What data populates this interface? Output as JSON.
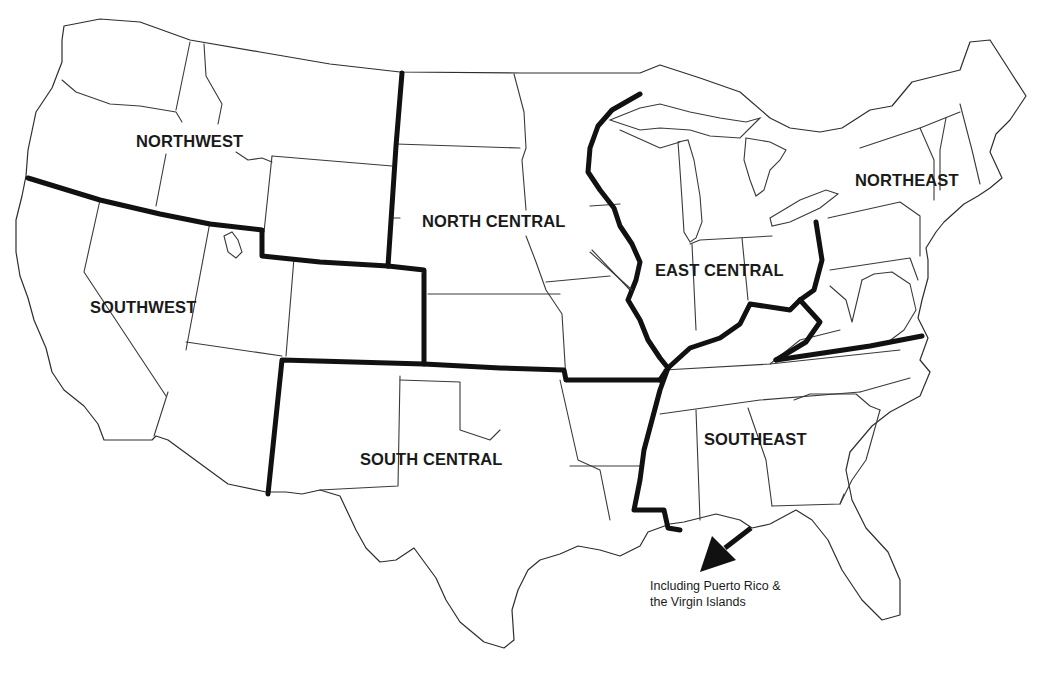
{
  "map": {
    "title": "",
    "type": "US regional map",
    "region_boundary_color": "#111111",
    "state_line_color": "#3a3a3a",
    "background": "#ffffff",
    "regions": [
      {
        "id": "northwest",
        "label": "NORTHWEST"
      },
      {
        "id": "southwest",
        "label": "SOUTHWEST"
      },
      {
        "id": "north_central",
        "label": "NORTH CENTRAL"
      },
      {
        "id": "south_central",
        "label": "SOUTH CENTRAL"
      },
      {
        "id": "east_central",
        "label": "EAST CENTRAL"
      },
      {
        "id": "northeast",
        "label": "NORTHEAST"
      },
      {
        "id": "southeast",
        "label": "SOUTHEAST"
      }
    ],
    "annotation": {
      "line1": "Including Puerto Rico &",
      "line2": "the Virgin Islands",
      "icon": "arrow-down-left-icon"
    }
  }
}
